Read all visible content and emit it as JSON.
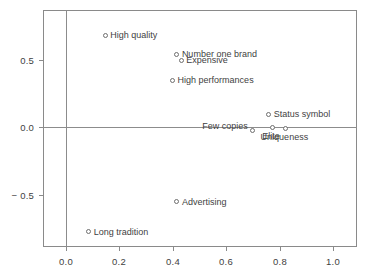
{
  "chart_data": {
    "type": "scatter",
    "title": "",
    "subtitle": "",
    "xlabel": "",
    "ylabel": "",
    "xlim": [
      -0.085,
      1.09
    ],
    "ylim": [
      -0.89,
      0.875
    ],
    "grid": false,
    "legend": "none",
    "zero_lines": true,
    "marker": "open-circle",
    "marker_color": "#6e6e6e",
    "axis_color": "#8a8a8a",
    "text_color": "#3f3f3f",
    "xticks": [
      {
        "value": 0.0,
        "label": "0.0"
      },
      {
        "value": 0.2,
        "label": "0.2"
      },
      {
        "value": 0.4,
        "label": "0.4"
      },
      {
        "value": 0.6,
        "label": "0.6"
      },
      {
        "value": 0.8,
        "label": "0.8"
      },
      {
        "value": 1.0,
        "label": "1.0"
      }
    ],
    "yticks": [
      {
        "value": 0.5,
        "label": "0.5"
      },
      {
        "value": 0.0,
        "label": "0.0"
      },
      {
        "value": -0.5,
        "label": "− 0.5"
      }
    ],
    "points": [
      {
        "label": "High quality",
        "x": 0.148,
        "y": 0.686,
        "label_side": "right"
      },
      {
        "label": "Number one brand",
        "x": 0.416,
        "y": 0.545,
        "label_side": "right"
      },
      {
        "label": "Expensive",
        "x": 0.432,
        "y": 0.5,
        "label_side": "right"
      },
      {
        "label": "High performances",
        "x": 0.4,
        "y": 0.351,
        "label_side": "right"
      },
      {
        "label": "Status symbol",
        "x": 0.76,
        "y": 0.097,
        "label_side": "right"
      },
      {
        "label": "Few copies",
        "x": 0.7,
        "y": -0.022,
        "label_side": "left"
      },
      {
        "label": "Elite",
        "x": 0.772,
        "y": 0.0,
        "label_side": "below"
      },
      {
        "label": "Uniqueness",
        "x": 0.822,
        "y": -0.007,
        "label_side": "below"
      },
      {
        "label": "Advertising",
        "x": 0.416,
        "y": -0.552,
        "label_side": "right"
      },
      {
        "label": "Long tradition",
        "x": 0.086,
        "y": -0.776,
        "label_side": "right"
      }
    ]
  }
}
